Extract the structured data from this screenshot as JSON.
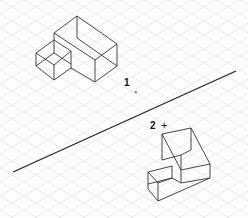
{
  "canvas": {
    "width": 248,
    "height": 218,
    "grid_color": "#dcdcdc",
    "line_color": "#222222"
  },
  "labels": {
    "one": "1",
    "two": "2",
    "cursor_marker": "×",
    "plus_marker": "+"
  },
  "objects": [
    {
      "name": "solid-1",
      "label": "1"
    },
    {
      "name": "solid-2",
      "label": "2"
    }
  ]
}
